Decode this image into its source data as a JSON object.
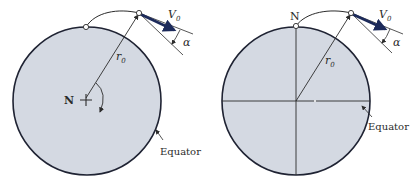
{
  "colors": {
    "earth_fill": "#d4d9e2",
    "earth_stroke": "#1f2333",
    "line": "#2b2b2b",
    "velocity_arrow": "#1c2a5a",
    "point_fill": "#ffffff"
  },
  "left_figure": {
    "pole_label": "N",
    "radius_label": "r",
    "radius_subscript": "0",
    "velocity_label": "V",
    "velocity_subscript": "0",
    "angle_label": "α",
    "equator_label": "Equator"
  },
  "right_figure": {
    "pole_label": "N",
    "radius_label": "r",
    "radius_subscript": "0",
    "velocity_label": "V",
    "velocity_subscript": "0",
    "angle_label": "α",
    "equator_label": "Equator"
  }
}
